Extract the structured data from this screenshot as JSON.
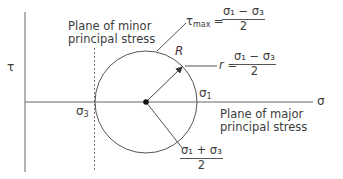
{
  "diagram": {
    "axes": {
      "vertical_label": "τ",
      "horizontal_label": "σ"
    },
    "points": {
      "sigma3": {
        "symbol": "σ",
        "sub": "3"
      },
      "sigma1": {
        "symbol": "σ",
        "sub": "1"
      }
    },
    "labels": {
      "minor_plane_line1": "Plane of minor",
      "minor_plane_line2": "principal stress",
      "major_plane_line1": "Plane of major",
      "major_plane_line2": "principal stress",
      "radius_marker": "R"
    },
    "formulas": {
      "tau_max": {
        "lhs": "τ",
        "lhs_sub": "max",
        "eq": " = ",
        "numerator": "σ₁ − σ₃",
        "denominator": "2"
      },
      "radius": {
        "lhs": "r",
        "eq": " = ",
        "numerator": "σ₁ − σ₃",
        "denominator": "2"
      },
      "center": {
        "numerator": "σ₁ + σ₃",
        "denominator": "2"
      }
    },
    "colors": {
      "line": "#555555",
      "text": "#3c3c3c",
      "center_dot": "#111111"
    }
  }
}
